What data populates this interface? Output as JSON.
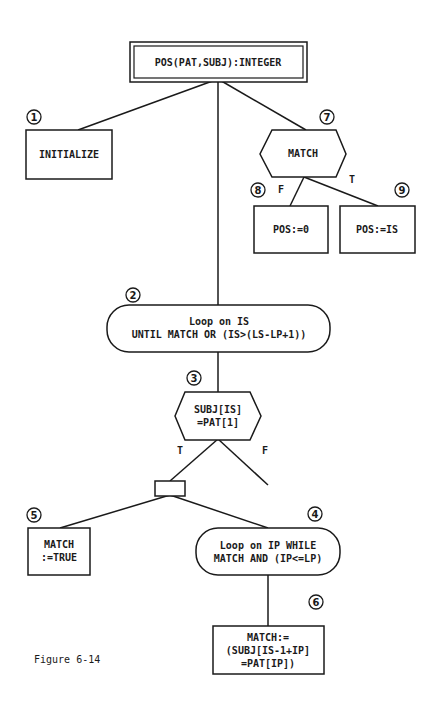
{
  "diagram": {
    "title": "POS(PAT,SUBJ):INTEGER",
    "nodes": {
      "n1": {
        "number": "1",
        "shape": "box",
        "lines": [
          "INITIALIZE"
        ]
      },
      "n7": {
        "number": "7",
        "shape": "hexagon",
        "lines": [
          "MATCH"
        ]
      },
      "n8": {
        "number": "8",
        "shape": "box",
        "lines": [
          "POS:=0"
        ]
      },
      "n9": {
        "number": "9",
        "shape": "box",
        "lines": [
          "POS:=IS"
        ]
      },
      "n2": {
        "number": "2",
        "shape": "loop",
        "lines": [
          "Loop on IS",
          "UNTIL MATCH OR (IS>(LS-LP+1))"
        ]
      },
      "n3": {
        "number": "3",
        "shape": "hexagon",
        "lines": [
          "SUBJ[IS]",
          "=PAT[1]"
        ]
      },
      "n5": {
        "number": "5",
        "shape": "box",
        "lines": [
          "MATCH",
          ":=TRUE"
        ]
      },
      "n4": {
        "number": "4",
        "shape": "loop",
        "lines": [
          "Loop on IP WHILE",
          "MATCH AND (IP<=LP)"
        ]
      },
      "n6": {
        "number": "6",
        "shape": "box",
        "lines": [
          "MATCH:=",
          "(SUBJ[IS-1+IP]",
          "=PAT[IP])"
        ]
      }
    },
    "branch_labels": {
      "n7_false": "F",
      "n7_true": "T",
      "n3_true": "T",
      "n3_false": "F"
    },
    "caption": "Figure 6-14"
  }
}
